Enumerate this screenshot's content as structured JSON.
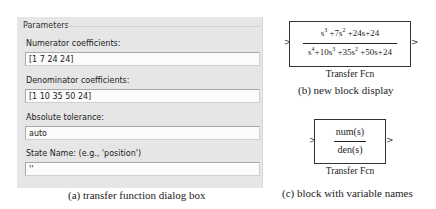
{
  "dialog": {
    "group_title": "Parameters",
    "fields": [
      {
        "label": "Numerator coefficients:",
        "value": "[1 7 24 24]"
      },
      {
        "label": "Denominator coefficients:",
        "value": "[1 10 35 50 24]"
      },
      {
        "label": "Absolute tolerance:",
        "value": "auto"
      },
      {
        "label": "State Name: (e.g., 'position')",
        "value": "''"
      }
    ]
  },
  "block_b": {
    "numerator": {
      "t1": "s",
      "e1": "3",
      "t2": " +7s",
      "e2": "2",
      "t3": " +24s+24"
    },
    "denominator": {
      "t1": "s",
      "e1": "4",
      "t2": "+10s",
      "e2": "3",
      "t3": " +35s",
      "e3": "2",
      "t4": " +50s+24"
    },
    "name": "Transfer Fcn",
    "input_port": ">",
    "output_port": ">"
  },
  "block_c": {
    "numerator": "num(s)",
    "denominator": "den(s)",
    "name": "Transfer Fcn",
    "input_port": ">",
    "output_port": ">"
  },
  "captions": {
    "a": "(a) transfer function dialog box",
    "b": "(b) new block display",
    "c": "(c) block with variable names"
  }
}
